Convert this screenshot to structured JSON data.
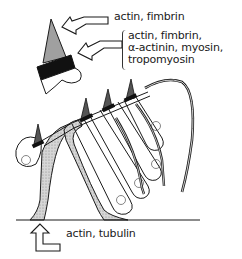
{
  "figure": {
    "type": "line-drawing",
    "colors": {
      "ink": "#1a1a1a",
      "stipple": "#b8b8b8",
      "tip_fill": "#9a9a9a",
      "band_fill": "#111111",
      "background": "#ffffff"
    }
  },
  "labels": {
    "tip": "actin, fimbrin",
    "band": {
      "lines": [
        "actin, fimbrin,",
        "α-actinin, myosin,",
        "tropomyosin"
      ]
    },
    "base": "actin, tubulin"
  },
  "arrows": [
    {
      "name": "tip-arrow",
      "points_to": "stereocilium tip"
    },
    {
      "name": "band-arrow",
      "points_to": "dark band (cuticular plate junction)"
    },
    {
      "name": "base-arrow",
      "points_to": "supporting cell base"
    }
  ]
}
